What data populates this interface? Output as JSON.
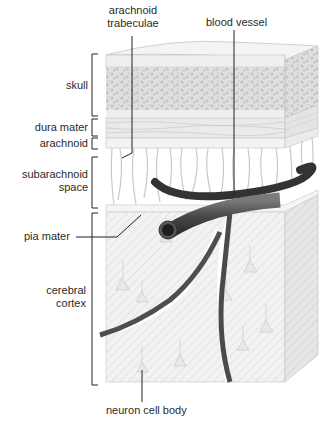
{
  "diagram": {
    "labels": {
      "arachnoid_trabeculae_line1": "arachnoid",
      "arachnoid_trabeculae_line2": "trabeculae",
      "blood_vessel": "blood vessel",
      "skull": "skull",
      "dura_mater": "dura mater",
      "arachnoid": "arachnoid",
      "subarachnoid_space_line1": "subarachnoid",
      "subarachnoid_space_line2": "space",
      "pia_mater": "pia mater",
      "cerebral_cortex_line1": "cerebral",
      "cerebral_cortex_line2": "cortex",
      "neuron_cell_body": "neuron cell body"
    },
    "layers_top_to_bottom": [
      "skull",
      "dura mater",
      "arachnoid",
      "subarachnoid space",
      "pia mater",
      "cerebral cortex"
    ],
    "colors": {
      "outline": "#bdbdbd",
      "skull_fill": "#eeeeee",
      "skull_spongy": "#d8d8d8",
      "tissue_fill": "#f0f0f0",
      "side_fill": "#e2e2e2",
      "vessel": "#5a5a5a",
      "vessel_dark": "#2e2e2e",
      "text": "#2a2a2a",
      "leader_line": "#222222"
    }
  }
}
